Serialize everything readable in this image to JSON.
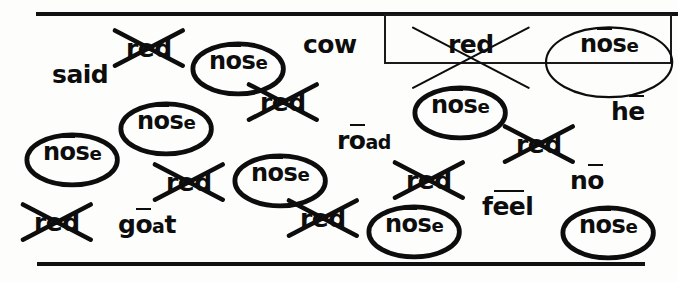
{
  "sheet": {
    "background_color": "#fdfdfc",
    "ink_color": "#0d0d0d",
    "rules": {
      "top_label": "top-horizontal-rule",
      "bottom_label": "bottom-horizontal-rule"
    }
  },
  "legend": {
    "title": "answer-key-box",
    "crossed_example": {
      "text": "red",
      "mark": "crossed-out"
    },
    "circled_example": {
      "text": "nose",
      "mark": "circled",
      "macron_on": "o"
    }
  },
  "words": [
    {
      "id": "w1",
      "text": "red",
      "mark": "crossed",
      "x": 112,
      "y": 26,
      "macron": null
    },
    {
      "id": "w2",
      "text": "nose",
      "mark": "circled",
      "x": 190,
      "y": 40,
      "macron": "o"
    },
    {
      "id": "w3",
      "text": "cow",
      "mark": "none",
      "x": 303,
      "y": 32,
      "macron": null
    },
    {
      "id": "w4",
      "text": "said",
      "mark": "none",
      "x": 52,
      "y": 62,
      "macron": null
    },
    {
      "id": "w5",
      "text": "red",
      "mark": "crossed",
      "x": 246,
      "y": 80,
      "macron": null
    },
    {
      "id": "w6",
      "text": "nose",
      "mark": "circled",
      "x": 118,
      "y": 100,
      "macron": "o"
    },
    {
      "id": "w7",
      "text": "nose",
      "mark": "circled",
      "x": 412,
      "y": 84,
      "macron": "o"
    },
    {
      "id": "w8",
      "text": "he",
      "mark": "none",
      "x": 611,
      "y": 99,
      "macron": "e"
    },
    {
      "id": "w9",
      "text": "nose",
      "mark": "circled",
      "x": 24,
      "y": 131,
      "macron": "o"
    },
    {
      "id": "w10",
      "text": "road",
      "mark": "none",
      "x": 337,
      "y": 128,
      "macron": "o"
    },
    {
      "id": "w11",
      "text": "red",
      "mark": "crossed",
      "x": 502,
      "y": 122,
      "macron": null
    },
    {
      "id": "w12",
      "text": "nose",
      "mark": "circled",
      "x": 232,
      "y": 152,
      "macron": "o"
    },
    {
      "id": "w13",
      "text": "red",
      "mark": "crossed",
      "x": 152,
      "y": 160,
      "macron": null
    },
    {
      "id": "w14",
      "text": "red",
      "mark": "crossed",
      "x": 392,
      "y": 158,
      "macron": null
    },
    {
      "id": "w15",
      "text": "no",
      "mark": "none",
      "x": 570,
      "y": 168,
      "macron": "o"
    },
    {
      "id": "w16",
      "text": "red",
      "mark": "crossed",
      "x": 286,
      "y": 196,
      "macron": null
    },
    {
      "id": "w17",
      "text": "nose",
      "mark": "circled",
      "x": 366,
      "y": 203,
      "macron": "o"
    },
    {
      "id": "w18",
      "text": "feel",
      "mark": "none",
      "x": 482,
      "y": 194,
      "macron": "ee"
    },
    {
      "id": "w19",
      "text": "nose",
      "mark": "circled",
      "x": 560,
      "y": 204,
      "macron": "o"
    },
    {
      "id": "w20",
      "text": "red",
      "mark": "crossed",
      "x": 20,
      "y": 200,
      "macron": null
    },
    {
      "id": "w21",
      "text": "goat",
      "mark": "none",
      "x": 118,
      "y": 212,
      "macron": "o"
    }
  ]
}
